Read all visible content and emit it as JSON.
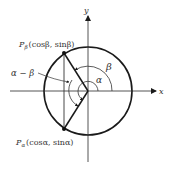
{
  "diagram": {
    "axes": {
      "x_label": "x",
      "y_label": "y"
    },
    "points": {
      "p_beta": {
        "name": "P",
        "subscript": "β",
        "coords": "(cosβ, sinβ)"
      },
      "p_alpha": {
        "name": "P",
        "subscript": "α",
        "coords": "(cosα, sinα)"
      }
    },
    "angles": {
      "alpha": "α",
      "beta": "β",
      "difference": "α − β"
    },
    "colors": {
      "stroke": "#1a1a1a",
      "text": "#333333",
      "background": "#ffffff"
    }
  }
}
